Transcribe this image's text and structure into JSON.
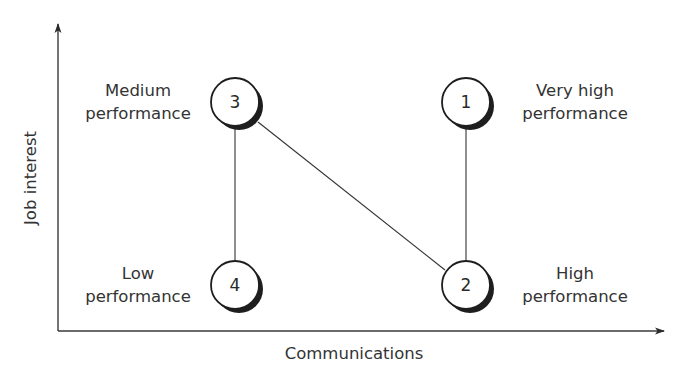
{
  "diagram": {
    "x_axis_label": "Communications",
    "y_axis_label": "Job interest",
    "nodes": [
      {
        "id": "1",
        "label_line1": "Very high",
        "label_line2": "performance",
        "cx": 466,
        "cy": 102
      },
      {
        "id": "2",
        "label_line1": "High",
        "label_line2": "performance",
        "cx": 466,
        "cy": 285
      },
      {
        "id": "3",
        "label_line1": "Medium",
        "label_line2": "performance",
        "cx": 235,
        "cy": 102
      },
      {
        "id": "4",
        "label_line1": "Low",
        "label_line2": "performance",
        "cx": 235,
        "cy": 285
      }
    ],
    "edges": [
      {
        "from": "3",
        "to": "4"
      },
      {
        "from": "3",
        "to": "2"
      },
      {
        "from": "1",
        "to": "2"
      }
    ],
    "colors": {
      "stroke": "#2a2a2a",
      "text": "#333333",
      "background": "#ffffff"
    }
  }
}
